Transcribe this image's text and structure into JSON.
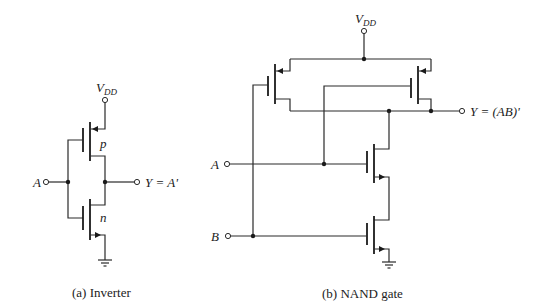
{
  "inverter": {
    "vdd_label": "V",
    "vdd_sub": "DD",
    "pmos_label": "p",
    "nmos_label": "n",
    "input_label": "A",
    "output_label": "Y = A'",
    "caption": "(a) Inverter"
  },
  "nand": {
    "vdd_label": "V",
    "vdd_sub": "DD",
    "input_a_label": "A",
    "input_b_label": "B",
    "output_label": "Y = (AB)'",
    "caption": "(b) NAND gate"
  },
  "colors": {
    "wire": "#2a2a2a",
    "background": "#ffffff"
  }
}
